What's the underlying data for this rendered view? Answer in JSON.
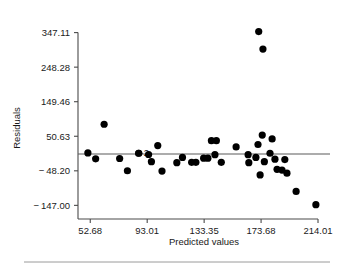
{
  "chart_data": {
    "type": "scatter",
    "title": "",
    "xlabel": "Predicted values",
    "ylabel": "Residuals",
    "xticks": [
      52.68,
      93.01,
      133.35,
      173.68,
      214.01
    ],
    "xtick_labels": [
      "52.68",
      "93.01",
      "133.35",
      "173.68",
      "214.01"
    ],
    "yticks": [
      347.11,
      248.28,
      149.46,
      50.63,
      -48.2,
      -147.0
    ],
    "ytick_labels": [
      "347.11",
      "248.28",
      "149.46",
      "50.63",
      "-48.20",
      "-147.00"
    ],
    "xlim": [
      44.0,
      222.5
    ],
    "ylim": [
      -186.0,
      386.0
    ],
    "grid": false,
    "legend": null,
    "reference_line": {
      "type": "horizontal",
      "y": 0.0,
      "label": ""
    },
    "annotations": [
      {
        "text": "2",
        "x": 87.0,
        "y": 4.0,
        "meaning": "two-overlapping-points"
      }
    ],
    "marker": {
      "shape": "circle",
      "color": "#000000",
      "size": 3.6
    },
    "points": [
      {
        "x": 51.0,
        "y": 3.0
      },
      {
        "x": 56.5,
        "y": -14.0
      },
      {
        "x": 62.5,
        "y": 85.0
      },
      {
        "x": 73.5,
        "y": -13.0
      },
      {
        "x": 79.0,
        "y": -48.0
      },
      {
        "x": 87.0,
        "y": 2.0
      },
      {
        "x": 87.0,
        "y": 2.0
      },
      {
        "x": 94.0,
        "y": -1.5
      },
      {
        "x": 96.0,
        "y": -22.0
      },
      {
        "x": 100.5,
        "y": 24.0
      },
      {
        "x": 103.5,
        "y": -49.0
      },
      {
        "x": 114.0,
        "y": -25.0
      },
      {
        "x": 118.0,
        "y": -10.0
      },
      {
        "x": 124.5,
        "y": -24.0
      },
      {
        "x": 127.5,
        "y": -24.0
      },
      {
        "x": 133.0,
        "y": -12.0
      },
      {
        "x": 136.0,
        "y": -12.0
      },
      {
        "x": 138.5,
        "y": 38.0
      },
      {
        "x": 142.0,
        "y": 38.0
      },
      {
        "x": 141.0,
        "y": -2.0
      },
      {
        "x": 145.5,
        "y": -24.0
      },
      {
        "x": 156.0,
        "y": 20.0
      },
      {
        "x": 164.5,
        "y": -2.0
      },
      {
        "x": 165.0,
        "y": -25.0
      },
      {
        "x": 170.0,
        "y": -10.0
      },
      {
        "x": 171.5,
        "y": 27.0
      },
      {
        "x": 172.0,
        "y": 350.0
      },
      {
        "x": 175.0,
        "y": 300.0
      },
      {
        "x": 174.5,
        "y": 54.0
      },
      {
        "x": 176.0,
        "y": -22.0
      },
      {
        "x": 173.0,
        "y": -60.0
      },
      {
        "x": 180.0,
        "y": 2.0
      },
      {
        "x": 181.5,
        "y": 43.0
      },
      {
        "x": 183.5,
        "y": -15.0
      },
      {
        "x": 185.0,
        "y": -44.0
      },
      {
        "x": 188.5,
        "y": -46.0
      },
      {
        "x": 190.5,
        "y": -16.0
      },
      {
        "x": 192.0,
        "y": -55.0
      },
      {
        "x": 198.5,
        "y": -107.0
      },
      {
        "x": 212.5,
        "y": -145.0
      }
    ]
  },
  "figure": {
    "footer_rule": true
  }
}
